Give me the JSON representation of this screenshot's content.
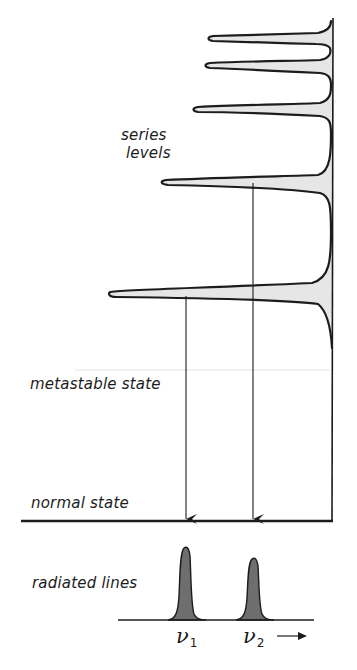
{
  "diagram": {
    "labels": {
      "series_levels_line1": "series",
      "series_levels_line2": "levels",
      "metastable_state": "metastable state",
      "normal_state": "normal state",
      "radiated_lines": "radiated lines"
    },
    "spectral_lines": [
      {
        "symbol": "ν",
        "subscript": "1"
      },
      {
        "symbol": "ν",
        "subscript": "2"
      }
    ],
    "frequency_arrow": "→",
    "colors": {
      "stroke": "#1c1c1c",
      "series_fill": "#e6e6e6",
      "line_fill": "#6e6e6e",
      "background": "#ffffff"
    },
    "series_level_count": 4,
    "transitions": [
      {
        "from": "lowest series level",
        "to": "normal state",
        "emits": "ν1"
      },
      {
        "from": "second series level",
        "to": "normal state",
        "emits": "ν2"
      }
    ]
  }
}
